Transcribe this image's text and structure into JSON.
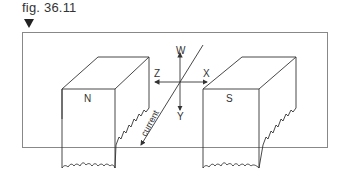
{
  "figure": {
    "label": "fig. 36.11",
    "marker_icon": "down-triangle-icon"
  },
  "diagram": {
    "magnet_left_label": "N",
    "magnet_right_label": "S",
    "axis_up": "W",
    "axis_down": "Y",
    "axis_left": "Z",
    "axis_right": "X",
    "current_label": "current"
  },
  "colors": {
    "line": "#333333",
    "frame": "#888888"
  }
}
